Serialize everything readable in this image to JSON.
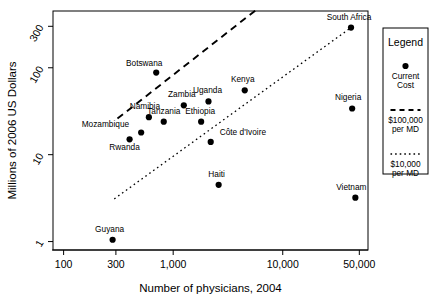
{
  "chart_data": {
    "type": "scatter",
    "title": "",
    "xlabel": "Number of physicians, 2004",
    "ylabel": "Millions of 2006 US Dollars",
    "xscale": "log",
    "yscale": "log",
    "xlim": [
      80,
      60000
    ],
    "ylim": [
      0.8,
      450
    ],
    "grid": false,
    "xticks": [
      "100",
      "300",
      "1,000",
      "10,000",
      "50,000"
    ],
    "xtick_values": [
      100,
      300,
      1000,
      10000,
      50000
    ],
    "yticks": [
      "300",
      "100",
      "10",
      "1"
    ],
    "ytick_values": [
      300,
      100,
      10,
      1
    ],
    "legend_position": "right-outside",
    "points": [
      {
        "label": "South Africa",
        "x": 42000,
        "y": 290,
        "lx": -2,
        "ly": -8,
        "anchor": "middle"
      },
      {
        "label": "Botswana",
        "x": 700,
        "y": 88,
        "lx": -12,
        "ly": -7,
        "anchor": "middle"
      },
      {
        "label": "Kenya",
        "x": 4500,
        "y": 55,
        "lx": -2,
        "ly": -8,
        "anchor": "middle"
      },
      {
        "label": "Uganda",
        "x": 2100,
        "y": 41,
        "lx": -1,
        "ly": -8,
        "anchor": "middle"
      },
      {
        "label": "Zambia",
        "x": 1250,
        "y": 37,
        "lx": -2,
        "ly": -8,
        "anchor": "middle"
      },
      {
        "label": "Nigeria",
        "x": 43000,
        "y": 34,
        "lx": -4,
        "ly": -8,
        "anchor": "middle"
      },
      {
        "label": "Namibia",
        "x": 600,
        "y": 27,
        "lx": -4,
        "ly": -8,
        "anchor": "middle"
      },
      {
        "label": "Tanzania",
        "x": 820,
        "y": 24,
        "lx": 0,
        "ly": -8,
        "anchor": "middle"
      },
      {
        "label": "Ethiopia",
        "x": 1800,
        "y": 24,
        "lx": -1,
        "ly": -8,
        "anchor": "middle"
      },
      {
        "label": "Mozambique",
        "x": 510,
        "y": 18,
        "lx": -12,
        "ly": -5,
        "anchor": "end"
      },
      {
        "label": "Rwanda",
        "x": 400,
        "y": 15,
        "lx": -5,
        "ly": 11,
        "anchor": "middle"
      },
      {
        "label": "Côte d'Ivoire",
        "x": 2200,
        "y": 14,
        "lx": 9,
        "ly": -7,
        "anchor": "start"
      },
      {
        "label": "Haiti",
        "x": 2600,
        "y": 4.5,
        "lx": -2,
        "ly": -8,
        "anchor": "middle"
      },
      {
        "label": "Vietnam",
        "x": 46000,
        "y": 3.2,
        "lx": -4,
        "ly": -8,
        "anchor": "middle"
      },
      {
        "label": "Guyana",
        "x": 280,
        "y": 1.05,
        "lx": -3,
        "ly": -8,
        "anchor": "middle"
      }
    ],
    "reference_lines": [
      {
        "name": "$100,000 per MD",
        "style": "dashed",
        "x1": 310,
        "y1": 26,
        "x2": 5800,
        "y2": 470
      },
      {
        "name": "$10,000 per MD",
        "style": "dotted",
        "x1": 290,
        "y1": 3.1,
        "x2": 42000,
        "y2": 290
      }
    ]
  },
  "legend": {
    "title": "Legend",
    "entries": [
      {
        "marker": "dot",
        "label_line1": "Current",
        "label_line2": "Cost"
      },
      {
        "marker": "dashed",
        "label_line1": "$100,000",
        "label_line2": "per MD"
      },
      {
        "marker": "dotted",
        "label_line1": "$10,000",
        "label_line2": "per MD"
      }
    ]
  },
  "colors": {
    "ink": "#000000",
    "background": "#ffffff"
  }
}
